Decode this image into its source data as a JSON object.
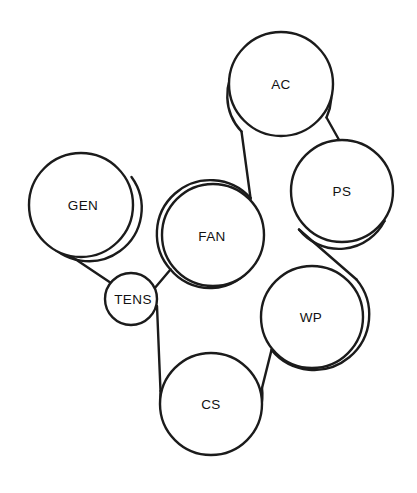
{
  "diagram": {
    "type": "belt-routing",
    "background_color": "#ffffff",
    "line_color": "#1b1b1b",
    "label_color": "#111111",
    "canvas": {
      "width": 417,
      "height": 493
    }
  },
  "pulleys": [
    {
      "id": "ac",
      "label": "AC",
      "cx": 281,
      "cy": 84,
      "r": 52,
      "label_x": 281,
      "label_y": 85
    },
    {
      "id": "ps",
      "label": "PS",
      "cx": 342,
      "cy": 191,
      "r": 51,
      "label_x": 342,
      "label_y": 192
    },
    {
      "id": "gen",
      "label": "GEN",
      "cx": 81,
      "cy": 205,
      "r": 52,
      "label_x": 83,
      "label_y": 206
    },
    {
      "id": "fan",
      "label": "FAN",
      "cx": 213,
      "cy": 235,
      "r": 51,
      "label_x": 212,
      "label_y": 237
    },
    {
      "id": "tens",
      "label": "TENS",
      "cx": 131,
      "cy": 299,
      "r": 26,
      "label_x": 133,
      "label_y": 300
    },
    {
      "id": "wp",
      "label": "WP",
      "cx": 312,
      "cy": 317,
      "r": 51,
      "label_x": 311,
      "label_y": 318
    },
    {
      "id": "cs",
      "label": "CS",
      "cx": 211,
      "cy": 404,
      "r": 51,
      "label_x": 211,
      "label_y": 405
    }
  ],
  "belt": {
    "name": "serpentine-belt",
    "route_order": [
      "GEN",
      "TENS",
      "FAN",
      "AC",
      "PS",
      "WP",
      "CS",
      "GEN"
    ],
    "segments": [
      {
        "id": "gen-top-wrap",
        "from": "GEN",
        "to": "FAN",
        "d": "M 131.5 177.0 A 52 52 0 1 1 46.0 239.5"
      },
      {
        "id": "gen-to-tens",
        "from": "GEN",
        "to": "TENS",
        "d": "M 46.0 239.5 L 111.0 283.0"
      },
      {
        "id": "tens-wrap",
        "from": "TENS",
        "to": "FAN",
        "d": "M 111.0 283.0 A 26 26 0 0 1 152.5 287.5"
      },
      {
        "id": "tens-to-fan",
        "from": "TENS",
        "to": "FAN",
        "d": "M 152.5 287.5 L 168.5 272.0"
      },
      {
        "id": "fan-left-wrap",
        "from": "FAN",
        "to": "AC",
        "d": "M 168.5 272.0 A 51 51 0 1 1 251.5 264.0"
      },
      {
        "id": "fan-to-ac",
        "from": "FAN",
        "to": "AC",
        "d": "M 249.5 200.0 L 242.0 131.0"
      },
      {
        "id": "ac-wrap",
        "from": "AC",
        "to": "PS",
        "d": "M 242.0 131.0 A 52 52 0 1 1 326.0 118.0"
      },
      {
        "id": "ac-to-ps",
        "from": "AC",
        "to": "PS",
        "d": "M 326.0 118.0 L 384.0 222.5"
      },
      {
        "id": "ps-wrap",
        "from": "PS",
        "to": "WP",
        "d": "M 384.0 222.5 A 51 51 0 0 1 300.0 230.0"
      },
      {
        "id": "ps-to-wp",
        "from": "PS",
        "to": "WP",
        "d": "M 300.0 230.0 L 355.0 280.0"
      },
      {
        "id": "wp-wrap",
        "from": "WP",
        "to": "CS",
        "d": "M 355.0 280.0 A 51 51 0 1 1 272.0 349.5"
      },
      {
        "id": "wp-to-cs",
        "from": "WP",
        "to": "CS",
        "d": "M 272.0 349.5 L 261.5 389.0"
      },
      {
        "id": "cs-wrap",
        "from": "CS",
        "to": "TENS",
        "d": "M 261.5 389.0 A 51 51 0 1 1 160.5 392.0"
      },
      {
        "id": "cs-to-tens",
        "from": "CS",
        "to": "TENS",
        "d": "M 160.5 392.0 L 157.0 307.0"
      },
      {
        "id": "fan-right-out",
        "from": "FAN",
        "to": "AC",
        "d": "M 251.5 264.0 L 249.5 200.0"
      }
    ]
  }
}
